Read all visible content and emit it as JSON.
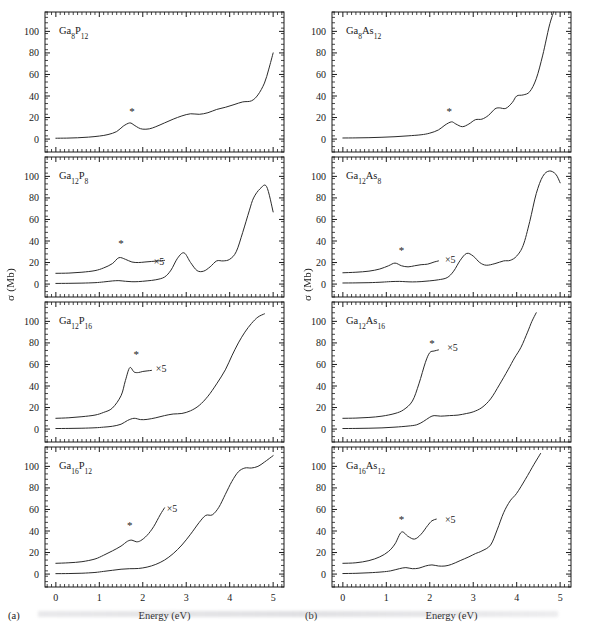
{
  "figure": {
    "axis_label_y": "σ (Mb)",
    "axis_label_x": "Energy (eV)",
    "sublabel_a": "(a)",
    "sublabel_b": "(b)",
    "scale_note": "×5",
    "star_note": "*"
  },
  "chart_data": {
    "type": "line",
    "title": "",
    "xlabel": "Energy (eV)",
    "ylabel": "σ (Mb)",
    "xlim": [
      -0.25,
      5.25
    ],
    "ylim": [
      -12,
      118
    ],
    "xticks": [
      0,
      1,
      2,
      3,
      4,
      5
    ],
    "yticks": [
      0,
      20,
      40,
      60,
      80,
      100
    ],
    "grid": false,
    "legend": "none",
    "annotations": [
      "×5 indicates the magnified (times five) low-energy trace",
      "* marks the first strong absorption peak"
    ],
    "panels": [
      {
        "column": "a",
        "row": 1,
        "label": "Ga8P12",
        "label_parts": [
          {
            "t": "Ga",
            "sub": false
          },
          {
            "t": "8",
            "sub": true
          },
          {
            "t": "P",
            "sub": false
          },
          {
            "t": "12",
            "sub": true
          }
        ],
        "has_x5_trace": false,
        "x5_label_xy": null,
        "star_xy": [
          1.75,
          22
        ],
        "series": [
          {
            "name": "sigma",
            "x": [
              0.0,
              0.25,
              0.5,
              0.75,
              1.0,
              1.2,
              1.4,
              1.55,
              1.7,
              1.8,
              1.9,
              2.0,
              2.15,
              2.3,
              2.5,
              2.7,
              2.9,
              3.1,
              3.3,
              3.5,
              3.7,
              3.9,
              4.1,
              4.3,
              4.5,
              4.65,
              4.8,
              4.9,
              5.0
            ],
            "y": [
              0.8,
              0.9,
              1.2,
              1.8,
              2.8,
              4.2,
              7.0,
              12.0,
              15.0,
              13.0,
              10.5,
              9.2,
              9.5,
              11.5,
              15.0,
              18.5,
              21.5,
              23.5,
              23.0,
              24.5,
              27.5,
              29.5,
              32.0,
              34.5,
              35.5,
              41.0,
              52.0,
              65.0,
              80.0
            ]
          }
        ]
      },
      {
        "column": "a",
        "row": 2,
        "label": "Ga12P8",
        "label_parts": [
          {
            "t": "Ga",
            "sub": false
          },
          {
            "t": "12",
            "sub": true
          },
          {
            "t": "P",
            "sub": false
          },
          {
            "t": "8",
            "sub": true
          }
        ],
        "has_x5_trace": true,
        "x5_label_xy": [
          2.25,
          21
        ],
        "star_xy": [
          1.5,
          34
        ],
        "series": [
          {
            "name": "sigma",
            "x": [
              0.0,
              0.3,
              0.6,
              0.9,
              1.1,
              1.3,
              1.45,
              1.6,
              1.75,
              1.9,
              2.1,
              2.3,
              2.5,
              2.65,
              2.8,
              2.95,
              3.1,
              3.25,
              3.4,
              3.55,
              3.7,
              3.85,
              4.0,
              4.15,
              4.3,
              4.45,
              4.55,
              4.7,
              4.85,
              5.0
            ],
            "y": [
              0.6,
              0.7,
              0.9,
              1.3,
              2.0,
              2.9,
              3.2,
              2.6,
              2.2,
              2.3,
              3.0,
              4.0,
              6.5,
              13.0,
              24.0,
              29.0,
              20.0,
              12.5,
              12.0,
              16.0,
              21.5,
              21.5,
              23.0,
              30.0,
              48.0,
              68.0,
              80.0,
              88.5,
              90.5,
              67.0
            ]
          },
          {
            "name": "sigma_x5_offset",
            "x": [
              0.0,
              0.3,
              0.6,
              0.9,
              1.1,
              1.3,
              1.45,
              1.6,
              1.75,
              1.9,
              2.05,
              2.2,
              2.35,
              2.5
            ],
            "y": [
              10.0,
              10.2,
              11.0,
              12.5,
              15.0,
              19.0,
              24.5,
              23.0,
              20.5,
              20.0,
              20.5,
              21.0,
              21.5,
              22.0
            ]
          }
        ]
      },
      {
        "column": "a",
        "row": 3,
        "label": "Ga12P16",
        "label_parts": [
          {
            "t": "Ga",
            "sub": false
          },
          {
            "t": "12",
            "sub": true
          },
          {
            "t": "P",
            "sub": false
          },
          {
            "t": "16",
            "sub": true
          }
        ],
        "has_x5_trace": true,
        "x5_label_xy": [
          2.3,
          56
        ],
        "star_xy": [
          1.85,
          66
        ],
        "series": [
          {
            "name": "sigma",
            "x": [
              0.0,
              0.3,
              0.6,
              0.9,
              1.1,
              1.3,
              1.5,
              1.65,
              1.8,
              1.95,
              2.1,
              2.3,
              2.5,
              2.7,
              2.9,
              3.1,
              3.3,
              3.5,
              3.7,
              3.9,
              4.05,
              4.2,
              4.35,
              4.5,
              4.65,
              4.8
            ],
            "y": [
              0.5,
              0.6,
              0.8,
              1.2,
              1.8,
              2.6,
              4.5,
              8.0,
              10.0,
              8.8,
              9.0,
              10.5,
              12.5,
              14.0,
              14.5,
              17.0,
              22.0,
              30.5,
              42.0,
              55.0,
              68.0,
              80.0,
              90.0,
              98.0,
              104.0,
              107.0
            ]
          },
          {
            "name": "sigma_x5_offset",
            "x": [
              0.0,
              0.3,
              0.6,
              0.9,
              1.1,
              1.3,
              1.5,
              1.6,
              1.7,
              1.8,
              1.9,
              2.0,
              2.1,
              2.2
            ],
            "y": [
              10.0,
              10.5,
              11.5,
              13.0,
              15.5,
              19.5,
              31.0,
              45.0,
              57.0,
              53.0,
              52.5,
              53.5,
              54.0,
              54.5
            ]
          }
        ]
      },
      {
        "column": "a",
        "row": 4,
        "label": "Ga16P12",
        "label_parts": [
          {
            "t": "Ga",
            "sub": false
          },
          {
            "t": "16",
            "sub": true
          },
          {
            "t": "P",
            "sub": false
          },
          {
            "t": "12",
            "sub": true
          }
        ],
        "has_x5_trace": true,
        "x5_label_xy": [
          2.55,
          61
        ],
        "star_xy": [
          1.7,
          42
        ],
        "series": [
          {
            "name": "sigma",
            "x": [
              0.0,
              0.3,
              0.6,
              0.9,
              1.1,
              1.3,
              1.5,
              1.7,
              1.9,
              2.1,
              2.3,
              2.5,
              2.7,
              2.9,
              3.1,
              3.3,
              3.45,
              3.6,
              3.75,
              3.9,
              4.05,
              4.2,
              4.35,
              4.5,
              4.65,
              4.8,
              5.0
            ],
            "y": [
              0.4,
              0.5,
              0.8,
              1.5,
              2.5,
              3.5,
              4.5,
              5.0,
              5.2,
              6.5,
              9.0,
              13.0,
              19.0,
              27.0,
              37.0,
              48.0,
              54.5,
              55.0,
              62.0,
              74.0,
              86.0,
              95.0,
              98.5,
              98.5,
              100.0,
              104.0,
              110.0
            ]
          },
          {
            "name": "sigma_x5_offset",
            "x": [
              0.0,
              0.3,
              0.6,
              0.9,
              1.1,
              1.3,
              1.5,
              1.65,
              1.75,
              1.85,
              1.95,
              2.1,
              2.25,
              2.4,
              2.5
            ],
            "y": [
              10.0,
              10.5,
              11.5,
              14.0,
              17.5,
              21.5,
              26.0,
              30.5,
              31.5,
              30.0,
              31.0,
              36.0,
              44.0,
              55.0,
              61.5
            ]
          }
        ]
      },
      {
        "column": "b",
        "row": 1,
        "label": "Ga8As12",
        "label_parts": [
          {
            "t": "Ga",
            "sub": false
          },
          {
            "t": "8",
            "sub": true
          },
          {
            "t": "As",
            "sub": false
          },
          {
            "t": "12",
            "sub": true
          }
        ],
        "has_x5_trace": false,
        "x5_label_xy": null,
        "star_xy": [
          2.45,
          22
        ],
        "series": [
          {
            "name": "sigma",
            "x": [
              0.0,
              0.3,
              0.6,
              0.9,
              1.2,
              1.5,
              1.8,
              2.0,
              2.2,
              2.35,
              2.5,
              2.6,
              2.75,
              2.9,
              3.05,
              3.2,
              3.35,
              3.5,
              3.6,
              3.75,
              3.9,
              4.0,
              4.15,
              4.3,
              4.45,
              4.6,
              4.75,
              4.85
            ],
            "y": [
              1.0,
              1.1,
              1.3,
              1.7,
              2.2,
              3.0,
              4.0,
              5.5,
              8.5,
              13.0,
              16.0,
              14.0,
              11.5,
              14.0,
              18.0,
              18.5,
              22.0,
              28.0,
              29.0,
              28.5,
              34.0,
              40.0,
              41.0,
              44.0,
              56.0,
              78.0,
              105.0,
              118.0
            ]
          }
        ]
      },
      {
        "column": "b",
        "row": 2,
        "label": "Ga12As8",
        "label_parts": [
          {
            "t": "Ga",
            "sub": false
          },
          {
            "t": "12",
            "sub": true
          },
          {
            "t": "As",
            "sub": false
          },
          {
            "t": "8",
            "sub": true
          }
        ],
        "has_x5_trace": true,
        "x5_label_xy": [
          2.35,
          23
        ],
        "star_xy": [
          1.35,
          28
        ],
        "series": [
          {
            "name": "sigma",
            "x": [
              0.0,
              0.3,
              0.6,
              0.9,
              1.1,
              1.3,
              1.45,
              1.6,
              1.8,
              2.0,
              2.2,
              2.4,
              2.55,
              2.7,
              2.85,
              3.0,
              3.15,
              3.3,
              3.5,
              3.7,
              3.85,
              4.0,
              4.15,
              4.3,
              4.45,
              4.6,
              4.75,
              4.9,
              5.0
            ],
            "y": [
              1.0,
              1.1,
              1.3,
              1.8,
              2.3,
              2.5,
              2.2,
              2.0,
              2.3,
              3.0,
              4.0,
              6.0,
              12.0,
              22.0,
              28.5,
              26.0,
              20.0,
              17.5,
              19.0,
              21.5,
              22.0,
              26.0,
              36.0,
              58.0,
              84.0,
              100.0,
              105.0,
              102.0,
              94.0
            ]
          },
          {
            "name": "sigma_x5_offset",
            "x": [
              0.0,
              0.3,
              0.6,
              0.85,
              1.05,
              1.2,
              1.35,
              1.5,
              1.65,
              1.8,
              1.95,
              2.1,
              2.2
            ],
            "y": [
              10.5,
              11.0,
              12.0,
              14.0,
              17.0,
              19.5,
              17.0,
              16.0,
              17.0,
              18.0,
              18.5,
              20.5,
              21.5
            ]
          }
        ]
      },
      {
        "column": "b",
        "row": 3,
        "label": "Ga12As16",
        "label_parts": [
          {
            "t": "Ga",
            "sub": false
          },
          {
            "t": "12",
            "sub": true
          },
          {
            "t": "As",
            "sub": false
          },
          {
            "t": "16",
            "sub": true
          }
        ],
        "has_x5_trace": true,
        "x5_label_xy": [
          2.4,
          76
        ],
        "star_xy": [
          2.05,
          76
        ],
        "series": [
          {
            "name": "sigma",
            "x": [
              0.0,
              0.3,
              0.6,
              0.9,
              1.2,
              1.5,
              1.7,
              1.85,
              2.0,
              2.1,
              2.25,
              2.45,
              2.65,
              2.85,
              3.0,
              3.2,
              3.4,
              3.6,
              3.8,
              3.95,
              4.1,
              4.25,
              4.35,
              4.45
            ],
            "y": [
              0.5,
              0.6,
              0.8,
              1.1,
              1.8,
              2.8,
              4.0,
              7.0,
              11.0,
              12.5,
              12.0,
              12.5,
              13.0,
              14.5,
              16.0,
              20.0,
              28.0,
              41.0,
              55.0,
              66.0,
              76.0,
              90.0,
              100.0,
              108.0
            ]
          },
          {
            "name": "sigma_x5_offset",
            "x": [
              0.0,
              0.3,
              0.6,
              0.9,
              1.2,
              1.4,
              1.6,
              1.75,
              1.9,
              2.0,
              2.1,
              2.2
            ],
            "y": [
              10.0,
              10.2,
              10.8,
              12.0,
              14.5,
              18.0,
              26.0,
              42.0,
              62.0,
              71.0,
              72.5,
              73.5
            ]
          }
        ]
      },
      {
        "column": "b",
        "row": 4,
        "label": "Ga16As12",
        "label_parts": [
          {
            "t": "Ga",
            "sub": false
          },
          {
            "t": "16",
            "sub": true
          },
          {
            "t": "As",
            "sub": false
          },
          {
            "t": "12",
            "sub": true
          }
        ],
        "has_x5_trace": true,
        "x5_label_xy": [
          2.35,
          51
        ],
        "star_xy": [
          1.35,
          47
        ],
        "series": [
          {
            "name": "sigma",
            "x": [
              0.0,
              0.3,
              0.6,
              0.9,
              1.1,
              1.3,
              1.45,
              1.6,
              1.75,
              1.9,
              2.05,
              2.2,
              2.35,
              2.5,
              2.7,
              2.9,
              3.05,
              3.2,
              3.4,
              3.55,
              3.7,
              3.85,
              4.0,
              4.2,
              4.4,
              4.55
            ],
            "y": [
              0.5,
              0.7,
              1.2,
              2.0,
              3.0,
              5.0,
              6.0,
              5.0,
              5.5,
              7.5,
              8.5,
              7.5,
              7.5,
              9.0,
              12.5,
              16.0,
              19.0,
              21.5,
              27.0,
              41.0,
              57.0,
              68.0,
              75.0,
              88.0,
              102.0,
              112.0
            ]
          },
          {
            "name": "sigma_x5_offset",
            "x": [
              0.0,
              0.3,
              0.6,
              0.85,
              1.05,
              1.2,
              1.35,
              1.5,
              1.65,
              1.8,
              1.95,
              2.05,
              2.15
            ],
            "y": [
              10.0,
              10.5,
              12.5,
              16.0,
              21.0,
              28.0,
              39.0,
              35.0,
              32.5,
              37.0,
              45.0,
              49.5,
              51.0
            ]
          }
        ]
      }
    ]
  }
}
